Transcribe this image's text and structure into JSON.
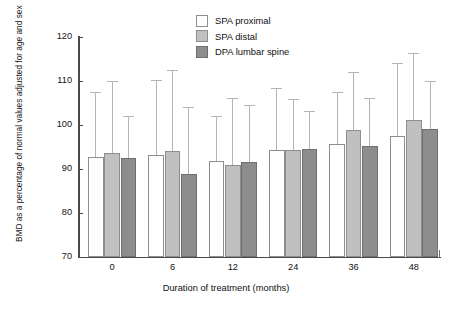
{
  "chart_data": {
    "type": "bar",
    "title": "",
    "xlabel": "Duration of treatment (months)",
    "ylabel": "BMD as a percentage of normal values adjusted for age and sex",
    "categories": [
      "0",
      "6",
      "12",
      "24",
      "36",
      "48"
    ],
    "ylim": [
      70,
      120
    ],
    "yticks": [
      "70",
      "80",
      "90",
      "100",
      "110",
      "120"
    ],
    "grid": false,
    "legend_position": "top-center",
    "error_bars": "upper-only",
    "series": [
      {
        "name": "SPA proximal",
        "color": "#ffffff",
        "values": [
          92.8,
          93.1,
          91.8,
          94.4,
          95.6,
          97.5
        ],
        "error_upper": [
          107.4,
          110.2,
          102.1,
          108.3,
          107.6,
          114.2
        ]
      },
      {
        "name": "SPA distal",
        "color": "#c0c0c0",
        "values": [
          93.6,
          94.2,
          90.9,
          94.4,
          98.8,
          101.1
        ],
        "error_upper": [
          110.0,
          112.4,
          106.2,
          105.9,
          112.0,
          116.4
        ]
      },
      {
        "name": "DPA lumbar spine",
        "color": "#8d8d8d",
        "values": [
          92.6,
          88.8,
          91.7,
          94.6,
          95.2,
          99.0
        ],
        "error_upper": [
          102.1,
          104.0,
          104.5,
          103.1,
          106.1,
          110.0
        ]
      }
    ]
  },
  "legend": {
    "items": [
      {
        "label": "SPA proximal"
      },
      {
        "label": "SPA distal"
      },
      {
        "label": "DPA lumbar spine"
      }
    ]
  }
}
